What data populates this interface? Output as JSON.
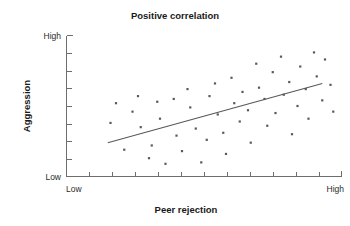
{
  "chart_data": {
    "type": "scatter",
    "title": "Positive correlation",
    "xlabel": "Peer rejection",
    "ylabel": "Aggression",
    "xlim": [
      0,
      100
    ],
    "ylim": [
      0,
      100
    ],
    "grid": false,
    "legend": null,
    "x_tick_labels": [
      "Low",
      "High"
    ],
    "y_tick_labels": [
      "Low",
      "High"
    ],
    "x_axis_low_label": "Low",
    "x_axis_high_label": "High",
    "y_axis_low_label": "Low",
    "y_axis_high_label": "High",
    "x_minor_tick_count": 11,
    "y_minor_tick_count": 7,
    "series": [
      {
        "name": "observations",
        "marker": "square",
        "color": "#5a5a5a",
        "points": [
          [
            16,
            38
          ],
          [
            18,
            52
          ],
          [
            21,
            19
          ],
          [
            24,
            46
          ],
          [
            26,
            57
          ],
          [
            27,
            35
          ],
          [
            30,
            13
          ],
          [
            31,
            22
          ],
          [
            33,
            53
          ],
          [
            34,
            41
          ],
          [
            36,
            9
          ],
          [
            39,
            55
          ],
          [
            40,
            29
          ],
          [
            42,
            18
          ],
          [
            44,
            62
          ],
          [
            45,
            49
          ],
          [
            47,
            34
          ],
          [
            49,
            10
          ],
          [
            51,
            26
          ],
          [
            52,
            57
          ],
          [
            54,
            66
          ],
          [
            55,
            44
          ],
          [
            57,
            31
          ],
          [
            58,
            16
          ],
          [
            60,
            70
          ],
          [
            61,
            52
          ],
          [
            63,
            39
          ],
          [
            64,
            60
          ],
          [
            66,
            47
          ],
          [
            67,
            24
          ],
          [
            69,
            80
          ],
          [
            70,
            63
          ],
          [
            72,
            55
          ],
          [
            73,
            36
          ],
          [
            75,
            74
          ],
          [
            76,
            45
          ],
          [
            78,
            85
          ],
          [
            79,
            58
          ],
          [
            81,
            67
          ],
          [
            82,
            30
          ],
          [
            84,
            50
          ],
          [
            85,
            78
          ],
          [
            87,
            62
          ],
          [
            88,
            41
          ],
          [
            90,
            88
          ],
          [
            91,
            71
          ],
          [
            93,
            54
          ],
          [
            94,
            83
          ],
          [
            96,
            65
          ],
          [
            97,
            46
          ]
        ]
      }
    ],
    "trend_line": {
      "type": "linear-fit",
      "x_start": 15,
      "y_start": 24,
      "x_end": 93,
      "y_end": 66,
      "color": "#585858"
    }
  }
}
